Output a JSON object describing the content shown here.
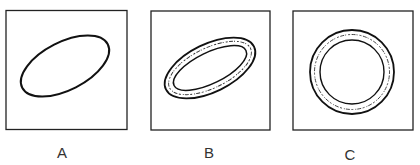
{
  "panels": [
    {
      "id": "A",
      "label": "A",
      "description": "Plain tilted ellipse"
    },
    {
      "id": "B",
      "label": "B",
      "description": "Tilted ellipse ring with irregular inner texture band"
    },
    {
      "id": "C",
      "label": "C",
      "description": "Circular ring with irregular inner texture band"
    }
  ],
  "colors": {
    "stroke": "#1a1a1a",
    "background": "#ffffff"
  }
}
